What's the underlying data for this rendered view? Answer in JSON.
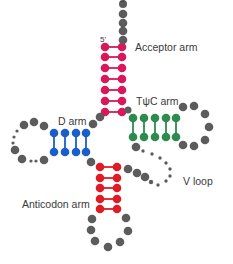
{
  "colors": {
    "acceptor": "#d8185a",
    "d_arm": "#1a5fc8",
    "tpsic_arm": "#2e8b4e",
    "anticodon": "#e01b24",
    "loop": "#5c5c5c",
    "text": "#3a3a3a"
  },
  "labels": {
    "three_prime": {
      "text": "3'",
      "x": 120,
      "y": -4
    },
    "five_prime": {
      "text": "5'",
      "x": 100,
      "y": 36
    },
    "acceptor_arm": {
      "text": "Acceptor arm",
      "x": 135,
      "y": 42
    },
    "tpsic_arm": {
      "text": "TψC arm",
      "x": 136,
      "y": 96
    },
    "d_arm": {
      "text": "D arm",
      "x": 58,
      "y": 116
    },
    "v_loop": {
      "text": "V loop",
      "x": 183,
      "y": 176
    },
    "anticodon_arm": {
      "text": "Anticodon arm",
      "x": 22,
      "y": 199
    }
  },
  "stems": [
    {
      "name": "acceptor-arm",
      "color_key": "acceptor",
      "orientation": "horizontal-pairs",
      "a": [
        [
          105,
          47
        ],
        [
          105,
          57
        ],
        [
          105,
          68
        ],
        [
          105,
          79
        ],
        [
          105,
          90
        ],
        [
          105,
          101
        ],
        [
          105,
          112
        ]
      ],
      "b": [
        [
          122,
          47
        ],
        [
          122,
          57
        ],
        [
          122,
          68
        ],
        [
          122,
          79
        ],
        [
          122,
          90
        ],
        [
          122,
          101
        ],
        [
          122,
          112
        ]
      ]
    },
    {
      "name": "d-arm",
      "color_key": "d_arm",
      "orientation": "vertical-pairs",
      "a": [
        [
          54,
          133
        ],
        [
          65,
          133
        ],
        [
          76,
          133
        ],
        [
          86,
          133
        ]
      ],
      "b": [
        [
          54,
          152
        ],
        [
          65,
          152
        ],
        [
          76,
          152
        ],
        [
          86,
          152
        ]
      ]
    },
    {
      "name": "tpsic-arm",
      "color_key": "tpsic_arm",
      "orientation": "vertical-pairs",
      "a": [
        [
          133,
          118
        ],
        [
          144,
          118
        ],
        [
          155,
          118
        ],
        [
          166,
          118
        ],
        [
          176,
          118
        ]
      ],
      "b": [
        [
          133,
          137
        ],
        [
          144,
          137
        ],
        [
          155,
          137
        ],
        [
          166,
          137
        ],
        [
          176,
          137
        ]
      ]
    },
    {
      "name": "anticodon-arm",
      "color_key": "anticodon",
      "orientation": "horizontal-pairs",
      "a": [
        [
          100,
          167
        ],
        [
          100,
          178
        ],
        [
          100,
          188
        ],
        [
          100,
          199
        ],
        [
          100,
          209
        ]
      ],
      "b": [
        [
          117,
          167
        ],
        [
          117,
          178
        ],
        [
          117,
          188
        ],
        [
          117,
          199
        ],
        [
          117,
          209
        ]
      ]
    }
  ],
  "loops": [
    {
      "name": "three-prime-tail",
      "dots": [
        [
          123,
          4,
          4
        ],
        [
          123,
          14,
          4.3
        ],
        [
          123,
          23,
          4.3
        ],
        [
          123,
          31,
          4.3
        ],
        [
          123,
          40,
          4.3
        ]
      ]
    },
    {
      "name": "acceptor-to-d-connector",
      "dots": [
        [
          100,
          117,
          4.3
        ],
        [
          93,
          124,
          4.3
        ]
      ]
    },
    {
      "name": "d-loop",
      "dots": [
        [
          44,
          126,
          4.3
        ],
        [
          34,
          122,
          4.3
        ],
        [
          24,
          125,
          4.3
        ],
        [
          17,
          131,
          1.6
        ],
        [
          14,
          137,
          1.6
        ],
        [
          13,
          143,
          1.6
        ],
        [
          15,
          150,
          4.3
        ],
        [
          22,
          159,
          4.3
        ],
        [
          31,
          161,
          1.6
        ],
        [
          36,
          161,
          1.6
        ],
        [
          44,
          160,
          4.3
        ]
      ]
    },
    {
      "name": "d-to-anticodon-connector",
      "dots": [
        [
          91,
          162,
          4.3
        ]
      ]
    },
    {
      "name": "tpsic-loop",
      "dots": [
        [
          183,
          107,
          4.3
        ],
        [
          194,
          106,
          4.3
        ],
        [
          205,
          114,
          4.3
        ],
        [
          209,
          127,
          4.3
        ],
        [
          205,
          140,
          4.3
        ],
        [
          194,
          146,
          4.3
        ],
        [
          183,
          145,
          4.3
        ]
      ]
    },
    {
      "name": "tpsic-to-acceptor-connector",
      "dots": [
        [
          128,
          110,
          3.5
        ]
      ]
    },
    {
      "name": "variable-loop",
      "dots": [
        [
          136,
          147,
          4.3
        ],
        [
          143,
          151,
          1.7
        ],
        [
          152,
          154,
          1.7
        ],
        [
          160,
          158,
          1.7
        ],
        [
          166,
          163,
          1.7
        ],
        [
          170,
          169,
          1.7
        ],
        [
          170,
          176,
          1.7
        ],
        [
          166,
          181,
          1.7
        ],
        [
          158,
          185,
          1.7
        ]
      ]
    },
    {
      "name": "anticodon-to-variable-connector",
      "dots": [
        [
          128,
          169,
          4.3
        ],
        [
          137,
          173,
          4.3
        ],
        [
          145,
          177,
          4.3
        ],
        [
          151,
          182,
          2.2
        ]
      ]
    },
    {
      "name": "anticodon-loop",
      "dots": [
        [
          92,
          219,
          4.3
        ],
        [
          91,
          230,
          4.3
        ],
        [
          95,
          241,
          4.3
        ],
        [
          108,
          247,
          4.3
        ],
        [
          120,
          242,
          4.3
        ],
        [
          128,
          231,
          4.3
        ],
        [
          126,
          218,
          4.3
        ]
      ]
    }
  ],
  "dot_radius": 4.3
}
